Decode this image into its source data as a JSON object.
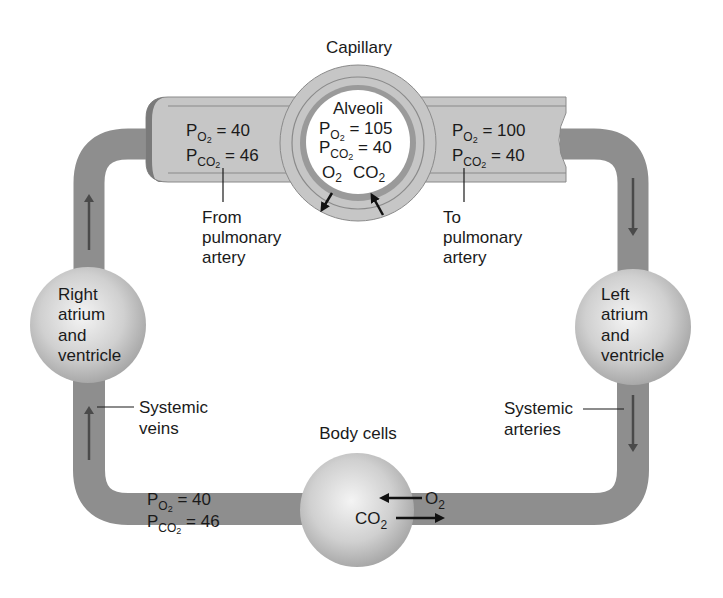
{
  "colors": {
    "vessel": "#8e8e8e",
    "vessel_dark": "#6e6e6e",
    "capillary_fill": "#c9c9c9",
    "capillary_band": "#bdbdbd",
    "capillary_line": "#8a8a8a",
    "membrane": "#9a9a9a",
    "sphere_light": "#f2f2f2",
    "sphere_dark": "#a9a9a9",
    "arrow": "#4a4a4a",
    "text": "#1a1a1a",
    "background": "#ffffff"
  },
  "capillary": {
    "title": "Capillary",
    "left": {
      "po2_label": "P",
      "po2_sub": "O",
      "po2_sub2": "2",
      "po2_value": " = 40",
      "pco2_label": "P",
      "pco2_sub": "CO",
      "pco2_sub2": "2",
      "pco2_value": " = 46"
    },
    "right": {
      "po2_label": "P",
      "po2_sub": "O",
      "po2_sub2": "2",
      "po2_value": " = 100",
      "pco2_label": "P",
      "pco2_sub": "CO",
      "pco2_sub2": "2",
      "pco2_value": " = 40"
    },
    "from_label": [
      "From",
      "pulmonary",
      "artery"
    ],
    "to_label": [
      "To",
      "pulmonary",
      "artery"
    ]
  },
  "alveoli": {
    "title": "Alveoli",
    "po2_label": "P",
    "po2_sub": "O",
    "po2_sub2": "2",
    "po2_value": " = 105",
    "pco2_label": "P",
    "pco2_sub": "CO",
    "pco2_sub2": "2",
    "pco2_value": " = 40",
    "gas_o2": "O",
    "gas_o2_sub": "2",
    "gas_co2": "CO",
    "gas_co2_sub": "2"
  },
  "right_heart": {
    "lines": [
      "Right",
      "atrium",
      "and",
      "ventricle"
    ]
  },
  "left_heart": {
    "lines": [
      "Left",
      "atrium",
      "and",
      "ventricle"
    ]
  },
  "systemic_veins": {
    "lines": [
      "Systemic",
      "veins"
    ]
  },
  "systemic_arteries": {
    "lines": [
      "Systemic",
      "arteries"
    ]
  },
  "body_cells": {
    "title": "Body cells",
    "gas_o2": "O",
    "gas_o2_sub": "2",
    "gas_co2": "CO",
    "gas_co2_sub": "2"
  },
  "venous_blood": {
    "po2_label": "P",
    "po2_sub": "O",
    "po2_sub2": "2",
    "po2_value": " = 40",
    "pco2_label": "P",
    "pco2_sub": "CO",
    "pco2_sub2": "2",
    "pco2_value": " = 46"
  }
}
